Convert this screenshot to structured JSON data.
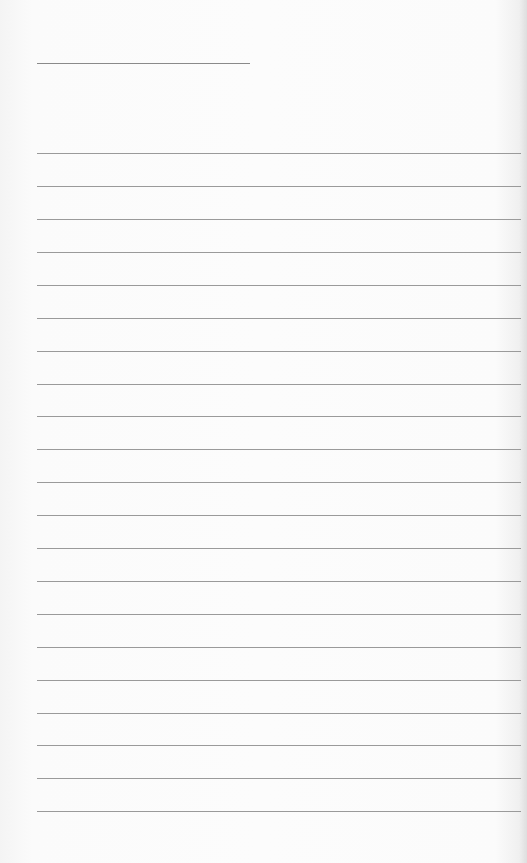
{
  "page": {
    "type": "lined-paper",
    "background_color": "#fbfbfb",
    "line_color": "#9a9a9a"
  },
  "title_line": {
    "y": 63,
    "x_start": 37,
    "x_end": 250
  },
  "ruled_lines": {
    "x_start": 37,
    "positions": [
      153,
      186,
      219,
      252,
      285,
      318,
      351,
      384,
      416,
      449,
      482,
      515,
      548,
      581,
      614,
      647,
      680,
      713,
      745,
      778,
      811
    ]
  }
}
